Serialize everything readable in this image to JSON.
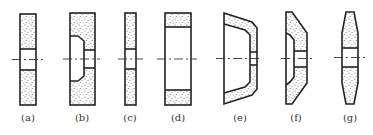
{
  "figure": {
    "colors": {
      "line": "#222222",
      "grit": "#555555",
      "background": "#ffffff"
    },
    "wheels": [
      {
        "id": "a",
        "label": "(a)",
        "shape": "flat straight wheel"
      },
      {
        "id": "b",
        "label": "(b)",
        "shape": "single recessed wheel"
      },
      {
        "id": "c",
        "label": "(c)",
        "shape": "thin straight wheel"
      },
      {
        "id": "d",
        "label": "(d)",
        "shape": "cylinder / ring wheel"
      },
      {
        "id": "e",
        "label": "(e)",
        "shape": "cup wheel (tapered)"
      },
      {
        "id": "f",
        "label": "(f)",
        "shape": "dish wheel"
      },
      {
        "id": "g",
        "label": "(g)",
        "shape": "double bevel wheel"
      }
    ]
  }
}
